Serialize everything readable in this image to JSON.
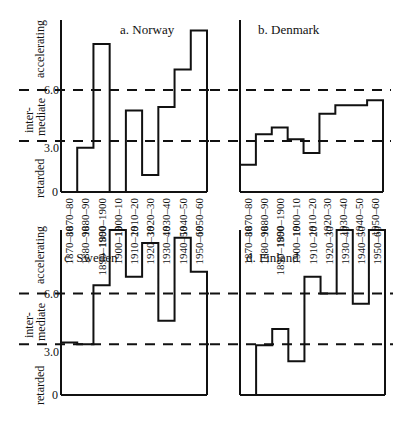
{
  "chart_data": [
    {
      "type": "bar",
      "title": "a. Norway",
      "categories": [
        "1870–80",
        "1880–90",
        "1890–1900",
        "1900–10",
        "1910–20",
        "1920–30",
        "1930–40",
        "1940–50",
        "1950–60"
      ],
      "values": [
        0,
        2.6,
        8.7,
        0,
        4.8,
        1.0,
        5.0,
        7.2,
        9.5
      ],
      "ylabel_bands": [
        "retarded",
        "inter-mediate",
        "accelerating"
      ],
      "yticks": [
        "0",
        "3.0",
        "6.0"
      ],
      "thresholds": [
        3.0,
        6.0
      ],
      "ylim": [
        0,
        10
      ]
    },
    {
      "type": "bar",
      "title": "b. Denmark",
      "categories": [
        "1870–80",
        "1880–90",
        "1890–1900",
        "1900–10",
        "1910–20",
        "1920–30",
        "1930–40",
        "1940–50",
        "1950–60"
      ],
      "values": [
        1.6,
        3.4,
        3.8,
        3.1,
        2.3,
        4.6,
        5.1,
        5.1,
        5.4
      ],
      "thresholds": [
        3.0,
        6.0
      ],
      "ylim": [
        0,
        10
      ]
    },
    {
      "type": "bar",
      "title": "c. Sweden",
      "categories": [
        "1870–80",
        "1880–90",
        "1890–1900",
        "1900–10",
        "1910–20",
        "1920–30",
        "1930–40",
        "1940–50",
        "1950–60"
      ],
      "values": [
        3.1,
        3.0,
        6.5,
        10.0,
        7.0,
        9.0,
        4.4,
        9.3,
        7.3
      ],
      "ylabel_bands": [
        "retarded",
        "inter-mediate",
        "accelerating"
      ],
      "yticks": [
        "0",
        "3.0",
        "6.0"
      ],
      "thresholds": [
        3.0,
        6.0
      ],
      "ylim": [
        0,
        10
      ]
    },
    {
      "type": "bar",
      "title": "d. Finland",
      "categories": [
        "1870–80",
        "1880–90",
        "1890–1900",
        "1900–10",
        "1910–20",
        "1920–30",
        "1930–40",
        "1940–50",
        "1950–60"
      ],
      "values": [
        0,
        2.95,
        3.9,
        2.0,
        7.0,
        6.0,
        10.0,
        5.4,
        10.0
      ],
      "thresholds": [
        3.0,
        6.0
      ],
      "ylim": [
        0,
        10
      ]
    }
  ],
  "labels": {
    "accelerating": "accelerating",
    "inter": "inter-",
    "mediate": "mediate",
    "retarded": "retarded",
    "tick6": "6.0",
    "tick3": "3.0",
    "tick0": "0"
  },
  "colors": {
    "ink": "#111111",
    "background": "#ffffff"
  }
}
